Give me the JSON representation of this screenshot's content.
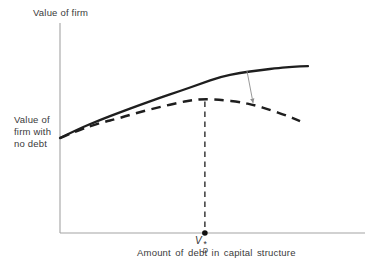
{
  "labels": {
    "y_axis_title": "Value of firm",
    "y_intercept_label": "Value of\nfirm with\nno debt",
    "x_axis_label": "Amount of debt in capital structure",
    "optimal_debt": {
      "base": "V",
      "sup": "*",
      "sub": "D"
    }
  },
  "colors": {
    "curve": "#1e1e1e",
    "axis": "#a3a3a3",
    "guideline": "#3a3a3a",
    "arrow": "#8c8c8c",
    "text": "#3a3a3a",
    "background": "#ffffff"
  },
  "chart_data": {
    "type": "line",
    "title": "",
    "ylabel": "Value of firm",
    "xlabel": "Amount of debt in capital structure",
    "x_domain": [
      0,
      100
    ],
    "y_domain": [
      0,
      100
    ],
    "grid": false,
    "ticks": "none",
    "legend": "none",
    "series": [
      {
        "name": "firm-value-without-distress-costs",
        "style": "solid",
        "points": [
          [
            0,
            45.2
          ],
          [
            6,
            49.5
          ],
          [
            13.1,
            53.8
          ],
          [
            19.7,
            57.5
          ],
          [
            26.2,
            61.0
          ],
          [
            32.8,
            64.4
          ],
          [
            39.3,
            67.6
          ],
          [
            46,
            71.0
          ],
          [
            52.5,
            74.3
          ],
          [
            59,
            76.2
          ],
          [
            65.6,
            77.6
          ],
          [
            72,
            78.6
          ],
          [
            76,
            79.1
          ],
          [
            81.3,
            79.5
          ]
        ]
      },
      {
        "name": "firm-value-with-distress-costs",
        "style": "dashed",
        "points": [
          [
            0,
            45.2
          ],
          [
            6,
            49.0
          ],
          [
            13.1,
            52.4
          ],
          [
            19.7,
            54.8
          ],
          [
            26.2,
            57.6
          ],
          [
            32.8,
            60.0
          ],
          [
            39.3,
            62.2
          ],
          [
            43.5,
            63.3
          ],
          [
            47.5,
            63.8
          ],
          [
            53,
            63.4
          ],
          [
            59,
            62.4
          ],
          [
            64,
            60.8
          ],
          [
            68.9,
            58.6
          ],
          [
            74,
            56.1
          ],
          [
            78.7,
            53.3
          ]
        ]
      }
    ],
    "annotations": {
      "optimal_debt_marker": {
        "label": "V*D",
        "x": 47.5,
        "y": 0
      },
      "no_debt_intercept": {
        "label": "Value of firm with no debt",
        "x": 0,
        "y": 45.2
      },
      "cost_gap_arrow": {
        "from": [
          61.3,
          77.2
        ],
        "to": [
          63.3,
          62.0
        ]
      }
    }
  }
}
